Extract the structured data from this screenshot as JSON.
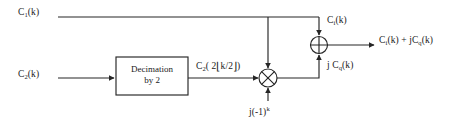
{
  "diagram": {
    "stroke_color": "#262626",
    "text_color": "#1a1a1a",
    "background": "#ffffff",
    "inputs": [
      {
        "id": "c1",
        "label_base": "C",
        "label_sub": "1",
        "label_tail": "(k)",
        "x": 18,
        "y": 8
      },
      {
        "id": "c2",
        "label_base": "C",
        "label_sub": "2",
        "label_tail": "(k)",
        "x": 18,
        "y": 70
      }
    ],
    "blocks": [
      {
        "id": "decimation",
        "line1": "Decimation",
        "line2": "by 2",
        "x": 116,
        "y": 57,
        "width": 72,
        "height": 38
      }
    ],
    "operators": [
      {
        "id": "multiplier",
        "glyph": "multiply-circle",
        "cx": 268,
        "cy": 78,
        "r": 9
      },
      {
        "id": "adder",
        "glyph": "plus-circle",
        "cx": 319,
        "cy": 45,
        "r": 8.5
      }
    ],
    "signal_labels": [
      {
        "id": "decimated",
        "text_pre": "C",
        "sub": "2",
        "text_post": "( 2",
        "bracket_open": "⌊",
        "inner": "k/2",
        "bracket_close": "⌋",
        "tail": ")",
        "x": 196,
        "y": 60
      },
      {
        "id": "ci-branch",
        "base": "C",
        "sub": "i",
        "tail": "(k)",
        "x": 327,
        "y": 16
      },
      {
        "id": "jcq-branch",
        "prefix": "j ",
        "base": "C",
        "sub": "q",
        "tail": "(k)",
        "x": 327,
        "y": 61
      },
      {
        "id": "rotator",
        "text": "j(-1)",
        "sup": "k",
        "x": 249,
        "y": 108
      },
      {
        "id": "output",
        "base1": "C",
        "sub1": "i",
        "mid": "(k) + j",
        "base2": "C",
        "sub2": "q",
        "tail": "(k)",
        "x": 379,
        "y": 36
      }
    ]
  }
}
